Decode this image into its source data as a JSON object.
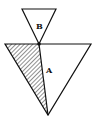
{
  "diagram": {
    "type": "geometry",
    "shapes": [
      {
        "id": "triangle-B",
        "label": "B",
        "points": [
          [
            22,
            9
          ],
          [
            56,
            9
          ],
          [
            39,
            44
          ]
        ],
        "fill": "none"
      },
      {
        "id": "triangle-A",
        "label": "A",
        "points": [
          [
            5,
            44
          ],
          [
            91,
            44
          ],
          [
            48,
            115
          ]
        ],
        "fill": "none"
      },
      {
        "id": "hatched-region",
        "points": [
          [
            5,
            44
          ],
          [
            39,
            44
          ],
          [
            48,
            115
          ]
        ],
        "fill": "hatch"
      }
    ],
    "joint_point": [
      39,
      44
    ],
    "labels": {
      "a": "A",
      "b": "B"
    },
    "colors": {
      "stroke": "#111111",
      "background": "#ffffff"
    }
  }
}
